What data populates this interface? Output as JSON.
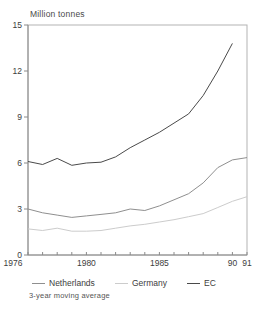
{
  "title": "Million tonnes",
  "footnote": "3-year moving average",
  "legend": {
    "items": [
      {
        "label": "Netherlands",
        "color": "#8f8f8f"
      },
      {
        "label": "Germany",
        "color": "#cccccc"
      },
      {
        "label": "EC",
        "color": "#4a4a4a"
      }
    ]
  },
  "chart_data": {
    "type": "line",
    "title": "Million tonnes",
    "subtitle": "3-year moving average",
    "xlabel": "",
    "ylabel": "Million tonnes",
    "xlim": [
      1976,
      1991
    ],
    "ylim": [
      0,
      15
    ],
    "yticks": [
      0,
      3,
      6,
      9,
      12,
      15
    ],
    "xticks_minor_every_year": true,
    "xticks_labeled": [
      {
        "year": 1976,
        "label": "1976",
        "shift": -15
      },
      {
        "year": 1980,
        "label": "1980",
        "shift": 0
      },
      {
        "year": 1985,
        "label": "1985",
        "shift": 0
      },
      {
        "year": 1990,
        "label": "90",
        "shift": 0
      },
      {
        "year": 1991,
        "label": "91",
        "shift": 0
      }
    ],
    "grid": false,
    "legend_position": "bottom",
    "series": [
      {
        "name": "Germany",
        "color": "#cccccc",
        "start_year": 1976,
        "values": [
          1.7,
          1.6,
          1.75,
          1.55,
          1.55,
          1.6,
          1.75,
          1.9,
          2.0,
          2.15,
          2.3,
          2.5,
          2.7,
          3.1,
          3.5,
          3.8
        ]
      },
      {
        "name": "Netherlands",
        "color": "#8f8f8f",
        "start_year": 1976,
        "values": [
          3.0,
          2.75,
          2.6,
          2.45,
          2.55,
          2.65,
          2.75,
          3.0,
          2.9,
          3.2,
          3.6,
          4.0,
          4.7,
          5.7,
          6.2,
          6.35
        ]
      },
      {
        "name": "EC",
        "color": "#4a4a4a",
        "start_year": 1976,
        "values": [
          6.1,
          5.9,
          6.3,
          5.85,
          6.0,
          6.05,
          6.4,
          7.0,
          7.5,
          8.0,
          8.6,
          9.2,
          10.4,
          12.0,
          13.8
        ]
      }
    ],
    "axis_color": "#b3b3b3",
    "tick_color": "#8a8a8a",
    "label_color": "#3d3d3d"
  }
}
